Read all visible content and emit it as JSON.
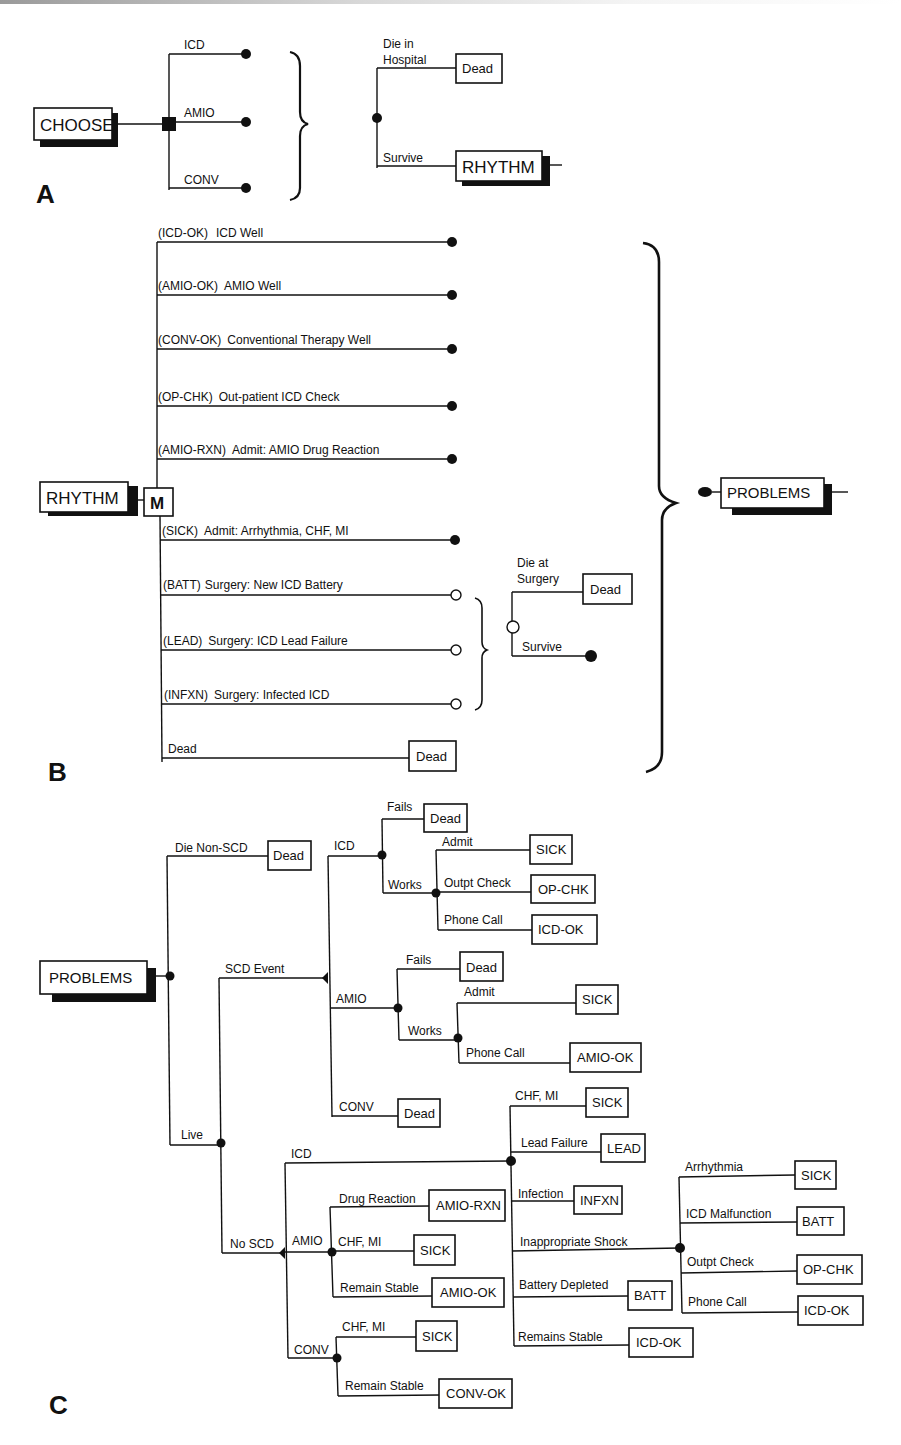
{
  "panels": {
    "a": "A",
    "b": "B",
    "c": "C"
  },
  "panel_a": {
    "root": "CHOOSE",
    "choices": [
      "ICD",
      "AMIO",
      "CONV"
    ],
    "hospital": {
      "die_label_1": "Die in",
      "die_label_2": "Hospital",
      "dead": "Dead",
      "survive": "Survive",
      "next": "RHYTHM"
    }
  },
  "panel_b": {
    "root": "RHYTHM",
    "markov": "M",
    "states": [
      {
        "code": "(ICD-OK)",
        "label": "ICD Well"
      },
      {
        "code": "(AMIO-OK)",
        "label": "AMIO Well"
      },
      {
        "code": "(CONV-OK)",
        "label": "Conventional Therapy Well"
      },
      {
        "code": "(OP-CHK)",
        "label": "Out-patient ICD Check"
      },
      {
        "code": "(AMIO-RXN)",
        "label": "Admit: AMIO Drug Reaction"
      },
      {
        "code": "(SICK)",
        "label": "Admit: Arrhythmia, CHF, MI"
      },
      {
        "code": "(BATT)",
        "label": "Surgery: New ICD Battery"
      },
      {
        "code": "(LEAD)",
        "label": "Surgery: ICD Lead Failure"
      },
      {
        "code": "(INFXN)",
        "label": "Surgery: Infected ICD"
      }
    ],
    "dead_branch": "Dead",
    "dead_box": "Dead",
    "surgery": {
      "die_label_1": "Die at",
      "die_label_2": "Surgery",
      "dead": "Dead",
      "survive": "Survive"
    },
    "next": "PROBLEMS"
  },
  "panel_c": {
    "root": "PROBLEMS",
    "die_non_scd": "Die Non-SCD",
    "live": "Live",
    "scd_event": "SCD Event",
    "no_scd": "No SCD",
    "dead": "Dead",
    "scd": {
      "icd": {
        "label": "ICD",
        "fails": "Fails",
        "works": "Works",
        "outcomes": [
          {
            "label": "Admit",
            "box": "SICK"
          },
          {
            "label": "Outpt Check",
            "box": "OP-CHK"
          },
          {
            "label": "Phone Call",
            "box": "ICD-OK"
          }
        ]
      },
      "amio": {
        "label": "AMIO",
        "fails": "Fails",
        "works": "Works",
        "outcomes": [
          {
            "label": "Admit",
            "box": "SICK"
          },
          {
            "label": "Phone Call",
            "box": "AMIO-OK"
          }
        ]
      },
      "conv": {
        "label": "CONV"
      }
    },
    "noscd": {
      "icd": {
        "label": "ICD",
        "outcomes": [
          {
            "label": "CHF, MI",
            "box": "SICK"
          },
          {
            "label": "Lead Failure",
            "box": "LEAD"
          },
          {
            "label": "Infection",
            "box": "INFXN"
          },
          {
            "label": "Inappropriate Shock",
            "box": ""
          },
          {
            "label": "Battery Depleted",
            "box": "BATT"
          },
          {
            "label": "Remains Stable",
            "box": "ICD-OK"
          }
        ],
        "shock_outcomes": [
          {
            "label": "Arrhythmia",
            "box": "SICK"
          },
          {
            "label": "ICD Malfunction",
            "box": "BATT"
          },
          {
            "label": "Outpt Check",
            "box": "OP-CHK"
          },
          {
            "label": "Phone Call",
            "box": "ICD-OK"
          }
        ]
      },
      "amio": {
        "label": "AMIO",
        "outcomes": [
          {
            "label": "Drug Reaction",
            "box": "AMIO-RXN"
          },
          {
            "label": "CHF, MI",
            "box": "SICK"
          },
          {
            "label": "Remain Stable",
            "box": "AMIO-OK"
          }
        ]
      },
      "conv": {
        "label": "CONV",
        "outcomes": [
          {
            "label": "CHF, MI",
            "box": "SICK"
          },
          {
            "label": "Remain Stable",
            "box": "CONV-OK"
          }
        ]
      }
    }
  }
}
